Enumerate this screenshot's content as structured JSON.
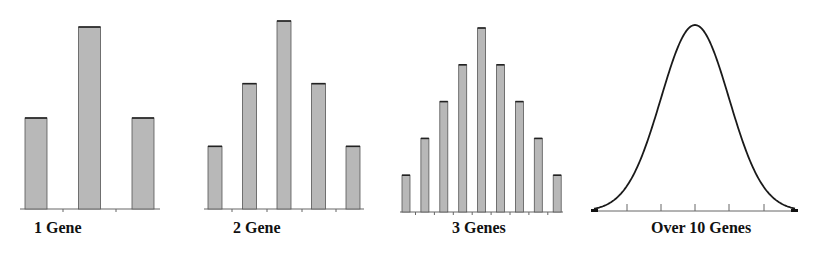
{
  "chart_data": [
    {
      "type": "bar",
      "title": "1 Gene",
      "categories": [
        "1",
        "2",
        "3"
      ],
      "values": [
        1,
        2,
        1
      ],
      "xlabel": "1 Gene",
      "ylabel": "",
      "grid": false
    },
    {
      "type": "bar",
      "title": "2 Gene",
      "categories": [
        "1",
        "2",
        "3",
        "4",
        "5"
      ],
      "values": [
        1,
        2,
        3,
        2,
        1
      ],
      "xlabel": "2 Gene",
      "ylabel": "",
      "grid": false
    },
    {
      "type": "bar",
      "title": "3 Genes",
      "categories": [
        "1",
        "2",
        "3",
        "4",
        "5",
        "6",
        "7",
        "8",
        "9"
      ],
      "values": [
        1,
        2,
        3,
        4,
        5,
        4,
        3,
        2,
        1
      ],
      "xlabel": "3 Genes",
      "ylabel": "",
      "grid": false
    },
    {
      "type": "line",
      "title": "Over 10 Genes",
      "description": "Smooth bell-shaped (normal) distribution curve",
      "x": [
        -3,
        -2,
        -1,
        0,
        1,
        2,
        3
      ],
      "values": [
        0.011,
        0.135,
        0.607,
        1.0,
        0.607,
        0.135,
        0.011
      ],
      "xlabel": "Over 10 Genes",
      "ylabel": "",
      "grid": false
    }
  ],
  "labels": {
    "chart1": "1 Gene",
    "chart2": "2 Gene",
    "chart3": "3 Genes",
    "chart4": "Over 10 Genes"
  }
}
